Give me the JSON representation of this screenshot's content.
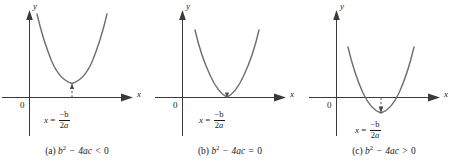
{
  "figure": {
    "type": "math-illustration",
    "background_color": "#ffffff",
    "curve_color": "#6e6e6e",
    "axis_color": "#3a3a3a"
  },
  "panels": [
    {
      "id": "a",
      "caption_label": "(a)",
      "caption_expr_base": "b",
      "caption_exponent": "2",
      "caption_minus": "−",
      "caption_term": "4ac",
      "caption_relation": "<",
      "caption_value": "0",
      "caption_full": "(a) b² − 4ac < 0",
      "y_axis_label": "y",
      "x_axis_label": "x",
      "origin_label": "0",
      "formula_var": "x",
      "formula_equals": "=",
      "formula_numerator": "−b",
      "formula_denominator_digit": "2",
      "formula_denominator_var": "a",
      "formula_full": "x = −b / 2a",
      "vertex_position": "above-axis",
      "roots": "none"
    },
    {
      "id": "b",
      "caption_label": "(b)",
      "caption_expr_base": "b",
      "caption_exponent": "2",
      "caption_minus": "−",
      "caption_term": "4ac",
      "caption_relation": "=",
      "caption_value": "0",
      "caption_full": "(b) b² − 4ac = 0",
      "y_axis_label": "y",
      "x_axis_label": "x",
      "origin_label": "0",
      "formula_var": "x",
      "formula_equals": "=",
      "formula_numerator": "−b",
      "formula_denominator_digit": "2",
      "formula_denominator_var": "a",
      "formula_full": "x = −b / 2a",
      "vertex_position": "on-axis",
      "roots": "one"
    },
    {
      "id": "c",
      "caption_label": "(c)",
      "caption_expr_base": "b",
      "caption_exponent": "2",
      "caption_minus": "−",
      "caption_term": "4ac",
      "caption_relation": ">",
      "caption_value": "0",
      "caption_full": "(c) b² − 4ac > 0",
      "y_axis_label": "y",
      "x_axis_label": "x",
      "origin_label": "0",
      "formula_var": "x",
      "formula_equals": "=",
      "formula_numerator": "−b",
      "formula_denominator_digit": "2",
      "formula_denominator_var": "a",
      "formula_full": "x = −b / 2a",
      "vertex_position": "below-axis",
      "roots": "two"
    }
  ]
}
